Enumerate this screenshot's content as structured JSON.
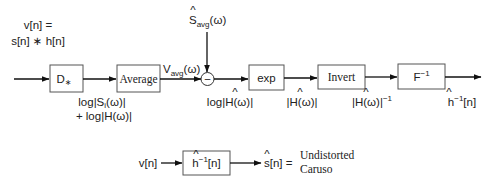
{
  "input": {
    "line1": "v[n] =",
    "line2": "s[n] ∗ h[n]"
  },
  "blocks": {
    "dstar": "D",
    "dstar_sub": "∗",
    "average": "Average",
    "exp": "exp",
    "invert": "Invert",
    "finv": "F",
    "finv_sup": "−1"
  },
  "subtract": {
    "symbol": "−",
    "top_input_main": "S",
    "top_input_sub": "avg",
    "top_input_tail": "(ω)"
  },
  "signals": {
    "vavg_main": "V",
    "vavg_sub": "avg",
    "vavg_tail": "(ω)",
    "after_dstar_1": "log|S",
    "after_dstar_1_sub": "i",
    "after_dstar_1_tail": "(ω)|",
    "after_dstar_2": "+ log|H(ω)|",
    "log_hhat": "log|H(ω)|",
    "abs_hhat": "|H(ω)|",
    "abs_hhat_inv": "|H(ω)|",
    "abs_hhat_inv_sup": "−1",
    "hinv_out": "h",
    "hinv_out_sup": "−1",
    "hinv_out_tail": "[n]"
  },
  "bottom": {
    "input": "v[n]",
    "filter_main": "h",
    "filter_sup": "−1",
    "filter_tail": "[n]",
    "output": "s[n] =",
    "result_line1": "Undistorted",
    "result_line2": "Caruso"
  }
}
